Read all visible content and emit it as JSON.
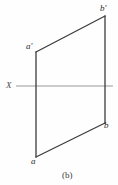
{
  "figure": {
    "caption": "(b)",
    "caption_x": 62,
    "caption_y": 171,
    "background_color": "#fefefe",
    "width": 118,
    "height": 185
  },
  "axis": {
    "label": "X",
    "label_x": 6,
    "label_y": 81,
    "line_color": "#9a9a9a",
    "line_y": 86,
    "line_x_start": 16,
    "line_x_end": 113,
    "stroke_width": 1.2
  },
  "geometry": {
    "line_color": "#3c3c3c",
    "stroke_width": 1.3,
    "points": {
      "a_prime": {
        "x": 36,
        "y": 52
      },
      "b_prime": {
        "x": 105,
        "y": 16
      },
      "a": {
        "x": 36,
        "y": 157
      },
      "b": {
        "x": 105,
        "y": 123
      }
    },
    "edges": [
      {
        "name": "front-view-line-a-prime-b-prime",
        "x1": 36,
        "y1": 52,
        "x2": 105,
        "y2": 16
      },
      {
        "name": "projector-left-a-prime-a",
        "x1": 36,
        "y1": 52,
        "x2": 36,
        "y2": 157
      },
      {
        "name": "projector-right-b-prime-b",
        "x1": 105,
        "y1": 16,
        "x2": 105,
        "y2": 123
      },
      {
        "name": "top-view-line-a-b",
        "x1": 36,
        "y1": 157,
        "x2": 105,
        "y2": 123
      }
    ]
  },
  "labels": {
    "b_prime": {
      "text": "b′",
      "x": 100,
      "y": 4
    },
    "a_prime": {
      "text": "a′",
      "x": 26,
      "y": 42
    },
    "b": {
      "text": "b",
      "x": 104,
      "y": 121
    },
    "a": {
      "text": "a",
      "x": 31,
      "y": 157
    }
  }
}
